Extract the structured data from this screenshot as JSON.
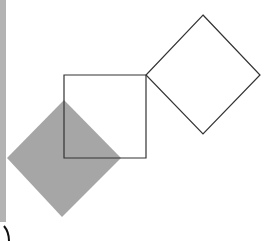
{
  "diagram": {
    "background": "#ffffff",
    "left_strip": {
      "color": "#b3b3b3"
    },
    "shapes": [
      {
        "id": "filled-diamond",
        "type": "polygon",
        "points": "64,100 121,158 62,217 7,158",
        "fill": "#a6a6a6",
        "stroke": "none"
      },
      {
        "id": "outline-square",
        "type": "polygon",
        "points": "64,75 146,75 146,158 64,158",
        "fill": "none",
        "stroke": "#333333"
      },
      {
        "id": "outline-diamond",
        "type": "polygon",
        "points": "203,15 260,75 203,134 146,75",
        "fill": "none",
        "stroke": "#333333"
      }
    ],
    "arc": {
      "path": "M 4 226 Q 9 232 9 241",
      "stroke": "#111111"
    }
  }
}
